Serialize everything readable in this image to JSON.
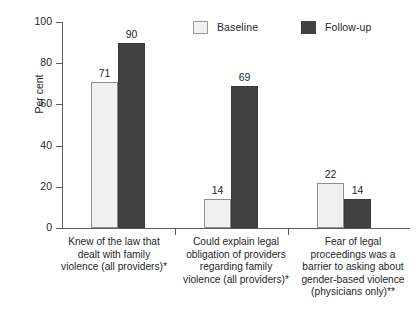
{
  "chart_data": {
    "type": "bar",
    "title": "",
    "subtitle": "",
    "xlabel": "",
    "ylabel": "Per cent",
    "ylim": [
      0,
      100
    ],
    "ytick_values": [
      0,
      20,
      40,
      60,
      80,
      100
    ],
    "ytick_labels": [
      "0",
      "20",
      "40",
      "60",
      "80",
      "100"
    ],
    "grid": false,
    "legend_position": "top-right",
    "categories": [
      "Knew of the law that dealt with family violence (all providers)*",
      "Could explain legal obligation of providers regarding family violence (all providers)*",
      "Fear of legal proceedings was a barrier to asking about gender-based violence (physicians only)**"
    ],
    "category_label_lines": [
      [
        "Knew of the law that",
        "dealt with family",
        "violence (all providers)*"
      ],
      [
        "Could explain legal",
        "obligation of providers",
        "regarding family",
        "violence (all providers)*"
      ],
      [
        "Fear of legal",
        "proceedings was a",
        "barrier to asking about",
        "gender-based violence",
        "(physicians only)**"
      ]
    ],
    "series": [
      {
        "name": "Baseline",
        "color": "#f0f0f0",
        "values": [
          71,
          14,
          22
        ]
      },
      {
        "name": "Follow-up",
        "color": "#414141",
        "values": [
          90,
          69,
          14
        ]
      }
    ],
    "data_labels": [
      [
        "71",
        "90"
      ],
      [
        "14",
        "69"
      ],
      [
        "22",
        "14"
      ]
    ]
  },
  "legend": {
    "entries": [
      {
        "label": "Baseline",
        "swatch": "legend-swatch-baseline"
      },
      {
        "label": "Follow-up",
        "swatch": "legend-swatch-followup"
      }
    ]
  },
  "axis": {
    "y_title": "Per cent",
    "y_ticks": [
      "100",
      "80",
      "60",
      "40",
      "20",
      "0"
    ]
  }
}
